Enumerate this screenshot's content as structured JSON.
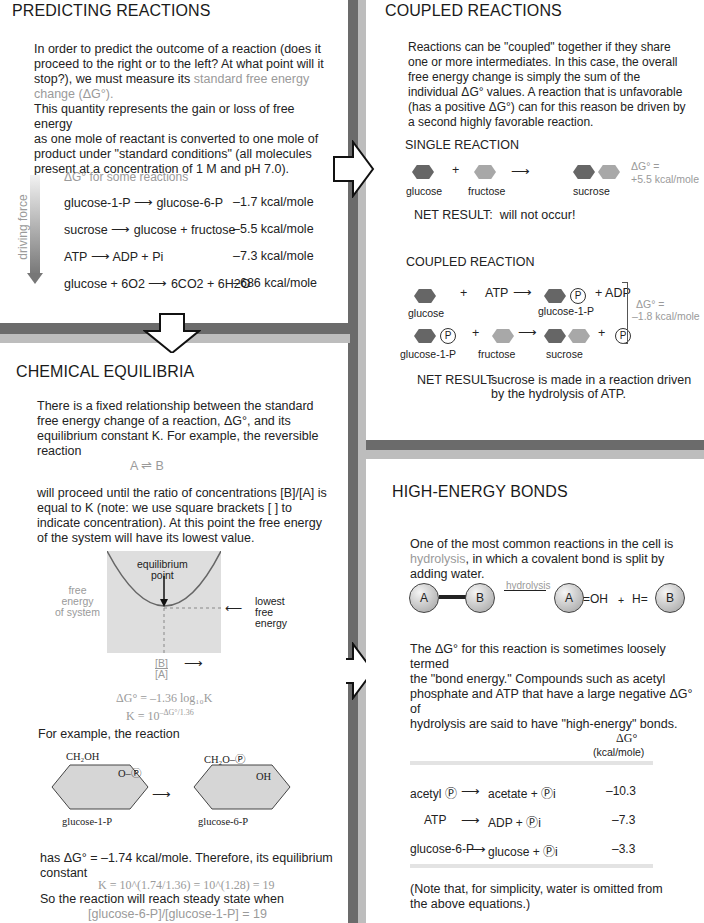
{
  "predicting": {
    "title": "PREDICTING REACTIONS",
    "p1a": "In order to predict the outcome of a reaction (does it",
    "p1b": "proceed to the right or to the left? At what point will it",
    "p1c": "stop?), we must measure its",
    "p1c_hl": "standard free energy",
    "p1d_hl": "change (ΔG°).",
    "p2a": "This quantity represents the gain or loss of free energy",
    "p2b": "as one mole of reactant is converted to one mole of",
    "p2c": "product under \"standard conditions\" (all molecules",
    "p2d": "present at a concentration of 1 M and pH 7.0).",
    "table_caption": "ΔG° for some reactions",
    "axis_label": "driving force",
    "rows": [
      {
        "reaction": "glucose-1-P ⟶ glucose-6-P",
        "value": "–1.7 kcal/mole"
      },
      {
        "reaction": "sucrose ⟶ glucose + fructose",
        "value": "–5.5 kcal/mole"
      },
      {
        "reaction": "ATP ⟶ ADP + Pi",
        "value": "–7.3 kcal/mole"
      },
      {
        "reaction": "glucose + 6O2 ⟶ 6CO2 + 6H2O",
        "value": "–686 kcal/mole"
      }
    ]
  },
  "coupled": {
    "title": "COUPLED REACTIONS",
    "p": [
      "Reactions can be \"coupled\" together if they share",
      "one or more intermediates. In this case, the overall",
      "free energy change is simply the sum of the",
      "individual ΔG° values. A reaction that is unfavorable",
      "(has a positive ΔG°) can for this reason be driven by",
      "a second highly favorable reaction."
    ],
    "single_title": "SINGLE REACTION",
    "single_labels": {
      "a": "glucose",
      "b": "fructose",
      "c": "sucrose"
    },
    "single_dg1": "ΔG° =",
    "single_dg2": "+5.5 kcal/mole",
    "net1_label": "NET RESULT:",
    "net1_text": "will not occur!",
    "coupled_title": "COUPLED REACTION",
    "row1": {
      "a": "glucose",
      "plus": "+",
      "atp": "ATP",
      "prod": "glucose-1-P",
      "adp": "+ ADP"
    },
    "row2": {
      "a": "glucose-1-P",
      "b": "fructose",
      "c": "sucrose"
    },
    "p_symbol": "P",
    "coupled_dg1": "ΔG° =",
    "coupled_dg2": "–1.8 kcal/mole",
    "net2_label": "NET RESULT:",
    "net2_line1": "sucrose is made in a reaction driven",
    "net2_line2": "by the hydrolysis of ATP."
  },
  "equilibria": {
    "title": "CHEMICAL EQUILIBRIA",
    "p1": [
      "There is a fixed relationship between the standard",
      "free energy change of a reaction, ΔG°, and its",
      "equilibrium constant K. For example, the reversible",
      "reaction"
    ],
    "reaction": "A ⇌ B",
    "p2": [
      "will proceed until the ratio of concentrations [B]/[A] is",
      "equal to K (note: we use square brackets [ ] to",
      "indicate concentration). At this point the free energy",
      "of the system will have its lowest value."
    ],
    "graph": {
      "eq_point": [
        "equilibrium",
        "point"
      ],
      "ylabel": [
        "free",
        "energy",
        "of system"
      ],
      "lowest": [
        "lowest",
        "free",
        "energy"
      ],
      "xnum": "[B]",
      "xden": "[A]"
    },
    "formula1": "ΔG° = –1.36 log₁₀K",
    "formula2_base": "K = 10",
    "formula2_exp": "–ΔG°/1.36",
    "example": "For example, the reaction",
    "struct1": {
      "top": "CH₂OH",
      "sub": "O–Ⓟ",
      "label": "glucose-1-P"
    },
    "struct2": {
      "top": "CH₂O–Ⓟ",
      "sub": "OH",
      "label": "glucose-6-P"
    },
    "has1": "has ΔG° = –1.74 kcal/mole. Therefore, its equilibrium",
    "has2": "constant",
    "k_line": "K = 10^(1.74/1.36) = 10^(1.28) = 19",
    "so": "So the reaction will reach steady state when",
    "ratio": "[glucose-6-P]/[glucose-1-P] = 19"
  },
  "highenergy": {
    "title": "HIGH-ENERGY BONDS",
    "p1a": "One of the most common reactions in the cell is",
    "p1b_hl": "hydrolysis",
    "p1b": ", in which a covalent bond is split by",
    "p1c": "adding water.",
    "diagram": {
      "a": "A",
      "b": "B",
      "arrow": "hydrolysis",
      "oh": "OH",
      "plus": "+",
      "h": "H"
    },
    "p2": [
      "The ΔG° for this reaction is sometimes loosely termed",
      "the \"bond energy.\" Compounds such as acetyl",
      "phosphate and ATP that have a large negative ΔG° of",
      "hydrolysis are said to have \"high-energy\" bonds."
    ],
    "col_head1": "ΔG°",
    "col_head2": "(kcal/mole)",
    "rows": [
      {
        "left": "acetyl Ⓟ",
        "right": "acetate + Ⓟi",
        "value": "–10.3"
      },
      {
        "left": "ATP",
        "right": "ADP + Ⓟi",
        "value": "–7.3"
      },
      {
        "left": "glucose-6-P",
        "right": "glucose + Ⓟi",
        "value": "–3.3"
      }
    ],
    "note1": "(Note that, for simplicity, water is omitted from",
    "note2": "the above equations.)"
  }
}
